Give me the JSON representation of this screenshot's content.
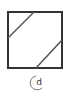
{
  "figure": {
    "label": "(d)",
    "label_text": "d",
    "stroke_color": "#333333",
    "background": "#ffffff"
  }
}
